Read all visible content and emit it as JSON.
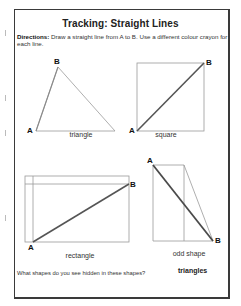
{
  "worksheet": {
    "title": "Tracking: Straight Lines",
    "directions_label": "Directions:",
    "directions_text": " Draw a straight line from A to B. Use a different colour crayon for each line.",
    "shapes": [
      {
        "name": "triangle",
        "point_a": "A",
        "point_b": "B"
      },
      {
        "name": "square",
        "point_a": "A",
        "point_b": "B"
      },
      {
        "name": "rectangle",
        "point_a": "A",
        "point_b": "B"
      },
      {
        "name": "odd shape",
        "point_a": "A",
        "point_b": "B"
      }
    ],
    "question": "What shapes do you see hidden in these shapes?",
    "answer": "triangles"
  },
  "colors": {
    "outline": "#9a9a9a",
    "traced_line": "#555555",
    "frame": "#3a3a3a"
  }
}
